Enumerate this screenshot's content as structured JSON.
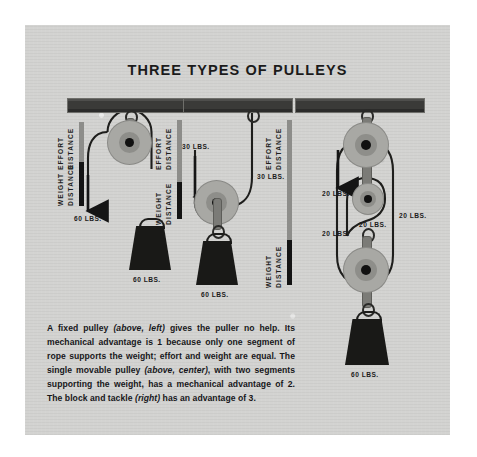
{
  "title": "THREE TYPES OF PULLEYS",
  "page": {
    "background_color": "#d3d3d1",
    "ink_color": "#1b1b1b",
    "wheel_color": "#a8a8a4",
    "beam_color": "#3a3a38"
  },
  "panels": [
    {
      "id": "fixed-pulley",
      "name": "fixed pulley",
      "effort_label_line1": "EFFORT",
      "effort_label_line2": "DISTANCE",
      "weight_label_line1": "WEIGHT",
      "weight_label_line2": "DISTANCE",
      "effort_force": "60 LBS.",
      "weight_force": "60 LBS.",
      "mechanical_advantage": 1,
      "pulley_count": 1,
      "effort_arrow_direction": "down"
    },
    {
      "id": "movable-pulley",
      "name": "single movable pulley",
      "effort_label_line1": "EFFORT",
      "effort_label_line2": "DISTANCE",
      "weight_label_line1": "WEIGHT",
      "weight_label_line2": "DISTANCE",
      "effort_force": "30 LBS.",
      "rope_force": "30 LBS.",
      "weight_force": "60 LBS.",
      "mechanical_advantage": 2,
      "pulley_count": 1,
      "effort_arrow_direction": "up"
    },
    {
      "id": "block-and-tackle",
      "name": "block and tackle",
      "effort_label_line1": "EFFORT",
      "effort_label_line2": "DISTANCE",
      "weight_label_line1": "WEIGHT",
      "weight_label_line2": "DISTANCE",
      "effort_force": "20 LBS.",
      "segment_force_1": "20 LBS.",
      "segment_force_2": "20 LBS.",
      "segment_force_3": "20 LBS.",
      "weight_force": "60 LBS.",
      "mechanical_advantage": 3,
      "pulley_count": 3,
      "effort_arrow_direction": "down"
    }
  ],
  "caption": {
    "l1a": "A fixed pulley ",
    "l1b": "(above, left)",
    "l1c": " gives the puller no help. Its mechanical advantage is 1 because only one segment of rope supports the weight; effort and weight are equal. The single movable pulley ",
    "l2b": "(above, center)",
    "l2c": ", with two segments supporting the weight, has a mechanical advantage of 2. The block and tackle ",
    "l3b": "(right)",
    "l3c": " has an advantage of 3."
  }
}
